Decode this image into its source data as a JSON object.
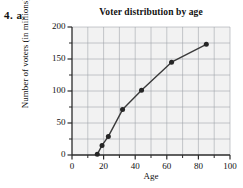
{
  "problem": {
    "label": "4.  a."
  },
  "chart_data": {
    "type": "line",
    "title": "Voter distribution by age",
    "xlabel": "Age",
    "ylabel": "Number of voters (in millions)",
    "xlim": [
      0,
      100
    ],
    "ylim": [
      0,
      200
    ],
    "xticks": [
      0,
      20,
      40,
      60,
      80,
      100
    ],
    "yticks": [
      0,
      50,
      100,
      150,
      200
    ],
    "xtick_labels": [
      "0",
      "20",
      "40",
      "60",
      "80",
      "100"
    ],
    "ytick_labels": [
      "0",
      "50",
      "100",
      "150",
      "200"
    ],
    "x_minor_step": 10,
    "y_minor_step": 25,
    "grid": true,
    "grid_color": "#9aa0a6",
    "plot_bg": "#f2f2f2",
    "line_color": "#3a3a3a",
    "marker_color": "#262626",
    "marker": "circle",
    "legend": null,
    "x": [
      16,
      19,
      23,
      32,
      44,
      63,
      85
    ],
    "y": [
      1,
      15,
      29,
      71,
      101,
      145,
      173
    ],
    "points": [
      {
        "x": 16,
        "y": 1
      },
      {
        "x": 19,
        "y": 15
      },
      {
        "x": 23,
        "y": 29
      },
      {
        "x": 32,
        "y": 71
      },
      {
        "x": 44,
        "y": 101
      },
      {
        "x": 63,
        "y": 145
      },
      {
        "x": 85,
        "y": 173
      }
    ]
  }
}
